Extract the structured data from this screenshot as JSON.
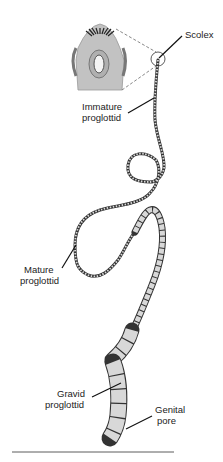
{
  "labels": {
    "scolex": "Scolex",
    "immature": [
      "Immature",
      "proglottid"
    ],
    "mature": [
      "Mature",
      "proglottid"
    ],
    "gravid": [
      "Gravid",
      "proglottid"
    ],
    "genital_pore": [
      "Genital",
      "pore"
    ]
  },
  "colors": {
    "body_fill": "#d6d6d6",
    "outline": "#333333",
    "inset_fill": "#bdbdbd"
  }
}
